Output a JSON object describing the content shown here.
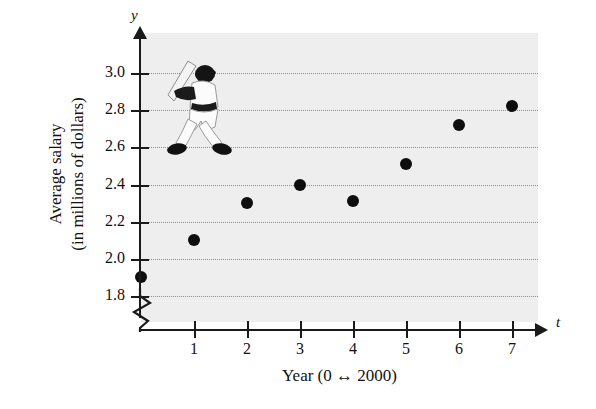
{
  "chart_data": {
    "type": "scatter",
    "title": "",
    "xlabel": "Year (0 ↔ 2000)",
    "ylabel_line1": "Average salary",
    "ylabel_line2": "(in millions of dollars)",
    "x_var": "t",
    "y_var": "y",
    "x": [
      0,
      1,
      2,
      3,
      4,
      5,
      6,
      7
    ],
    "values": [
      1.9,
      2.1,
      2.3,
      2.4,
      2.31,
      2.51,
      2.72,
      2.82
    ],
    "categories": [
      "0",
      "1",
      "2",
      "3",
      "4",
      "5",
      "6",
      "7"
    ],
    "xticks": [
      1,
      2,
      3,
      4,
      5,
      6,
      7
    ],
    "xtick_labels": [
      "1",
      "2",
      "3",
      "4",
      "5",
      "6",
      "7"
    ],
    "yticks": [
      1.8,
      2.0,
      2.2,
      2.4,
      2.6,
      2.8,
      3.0
    ],
    "ytick_labels": [
      "1.8",
      "2.0",
      "2.2",
      "2.4",
      "2.6",
      "2.8",
      "3.0"
    ],
    "xlim": [
      -0.25,
      7.6
    ],
    "ylim": [
      1.72,
      3.12
    ],
    "grid": "horizontal-dotted",
    "legend": "none",
    "axis_break": "y-axis below 1.8",
    "annotations": [
      "baseball batter illustration"
    ],
    "colors": {
      "plot_background": "#eeeeee",
      "point": "#0d0d0d",
      "axis": "#1a1a1a",
      "gridline": "#8e8e8e",
      "page_background": "#ffffff"
    }
  }
}
